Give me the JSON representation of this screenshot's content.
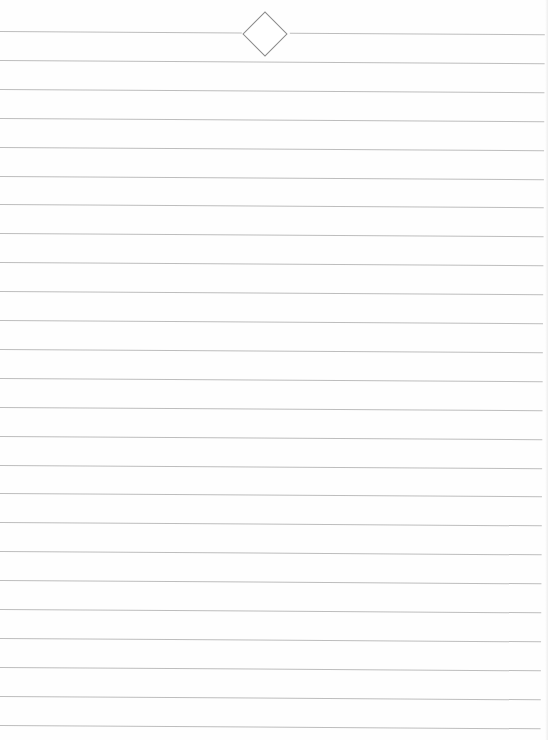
{
  "page": {
    "type": "lined-paper",
    "background": "#fefefe",
    "rule_color": "#bdbdbd",
    "rule_count": 25,
    "rule_spacing_px": 28.9,
    "first_rule_y": 31,
    "ornament": {
      "shape": "diamond-icon",
      "color": "#8a8a8a"
    }
  }
}
